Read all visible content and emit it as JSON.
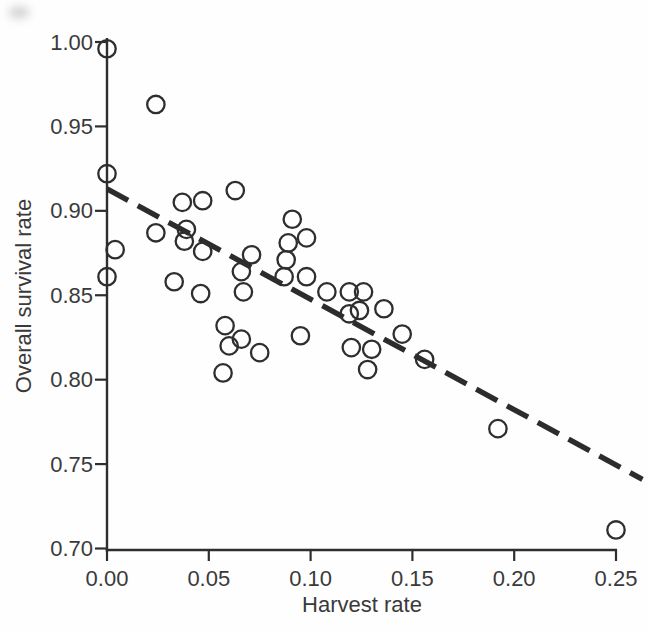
{
  "figure": {
    "background": "#fefefe",
    "ink_color": "#2e2e2e",
    "text_color": "#3a3a3a"
  },
  "chart_data": {
    "type": "scatter",
    "title": "",
    "xlabel": "Harvest rate",
    "ylabel": "Overall survival rate",
    "xlim": [
      0.0,
      0.25
    ],
    "ylim": [
      0.7,
      1.0
    ],
    "grid": false,
    "legend": "none",
    "xticks": [
      {
        "value": 0.0,
        "label": "0.00"
      },
      {
        "value": 0.05,
        "label": "0.05"
      },
      {
        "value": 0.1,
        "label": "0.10"
      },
      {
        "value": 0.15,
        "label": "0.15"
      },
      {
        "value": 0.2,
        "label": "0.20"
      },
      {
        "value": 0.25,
        "label": "0.25"
      }
    ],
    "yticks": [
      {
        "value": 1.0,
        "label": "1.00"
      },
      {
        "value": 0.95,
        "label": "0.95"
      },
      {
        "value": 0.9,
        "label": "0.90"
      },
      {
        "value": 0.85,
        "label": "0.85"
      },
      {
        "value": 0.8,
        "label": "0.80"
      },
      {
        "value": 0.75,
        "label": "0.75"
      },
      {
        "value": 0.7,
        "label": "0.70"
      }
    ],
    "marker": {
      "shape": "open-circle",
      "radius_px": 8.7,
      "stroke_px": 2.3
    },
    "points": [
      [
        0.0,
        0.996
      ],
      [
        0.024,
        0.963
      ],
      [
        0.0,
        0.922
      ],
      [
        0.004,
        0.877
      ],
      [
        0.0,
        0.861
      ],
      [
        0.037,
        0.905
      ],
      [
        0.047,
        0.906
      ],
      [
        0.063,
        0.912
      ],
      [
        0.024,
        0.887
      ],
      [
        0.039,
        0.889
      ],
      [
        0.038,
        0.882
      ],
      [
        0.047,
        0.876
      ],
      [
        0.033,
        0.858
      ],
      [
        0.046,
        0.851
      ],
      [
        0.058,
        0.832
      ],
      [
        0.06,
        0.82
      ],
      [
        0.066,
        0.824
      ],
      [
        0.075,
        0.816
      ],
      [
        0.057,
        0.804
      ],
      [
        0.071,
        0.874
      ],
      [
        0.066,
        0.864
      ],
      [
        0.067,
        0.852
      ],
      [
        0.091,
        0.895
      ],
      [
        0.089,
        0.881
      ],
      [
        0.098,
        0.884
      ],
      [
        0.088,
        0.871
      ],
      [
        0.087,
        0.861
      ],
      [
        0.098,
        0.861
      ],
      [
        0.095,
        0.826
      ],
      [
        0.108,
        0.852
      ],
      [
        0.119,
        0.852
      ],
      [
        0.126,
        0.852
      ],
      [
        0.119,
        0.839
      ],
      [
        0.124,
        0.841
      ],
      [
        0.136,
        0.842
      ],
      [
        0.12,
        0.819
      ],
      [
        0.13,
        0.818
      ],
      [
        0.128,
        0.806
      ],
      [
        0.145,
        0.827
      ],
      [
        0.156,
        0.812
      ],
      [
        0.192,
        0.771
      ],
      [
        0.25,
        0.711
      ]
    ],
    "trendline": {
      "style": "dashed",
      "x_start": 0.0,
      "y_start": 0.913,
      "x_end": 0.263,
      "y_end": 0.741
    }
  }
}
